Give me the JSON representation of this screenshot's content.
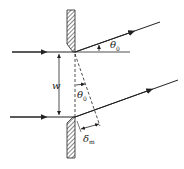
{
  "diagram": {
    "labels": {
      "theta_top": "θ",
      "theta_top_sub": "0",
      "theta_mid": "θ",
      "theta_mid_sub": "0",
      "width": "w",
      "delta": "δ",
      "delta_sub": "m"
    },
    "colors": {
      "stroke": "#222222",
      "hatch": "#333333"
    }
  }
}
